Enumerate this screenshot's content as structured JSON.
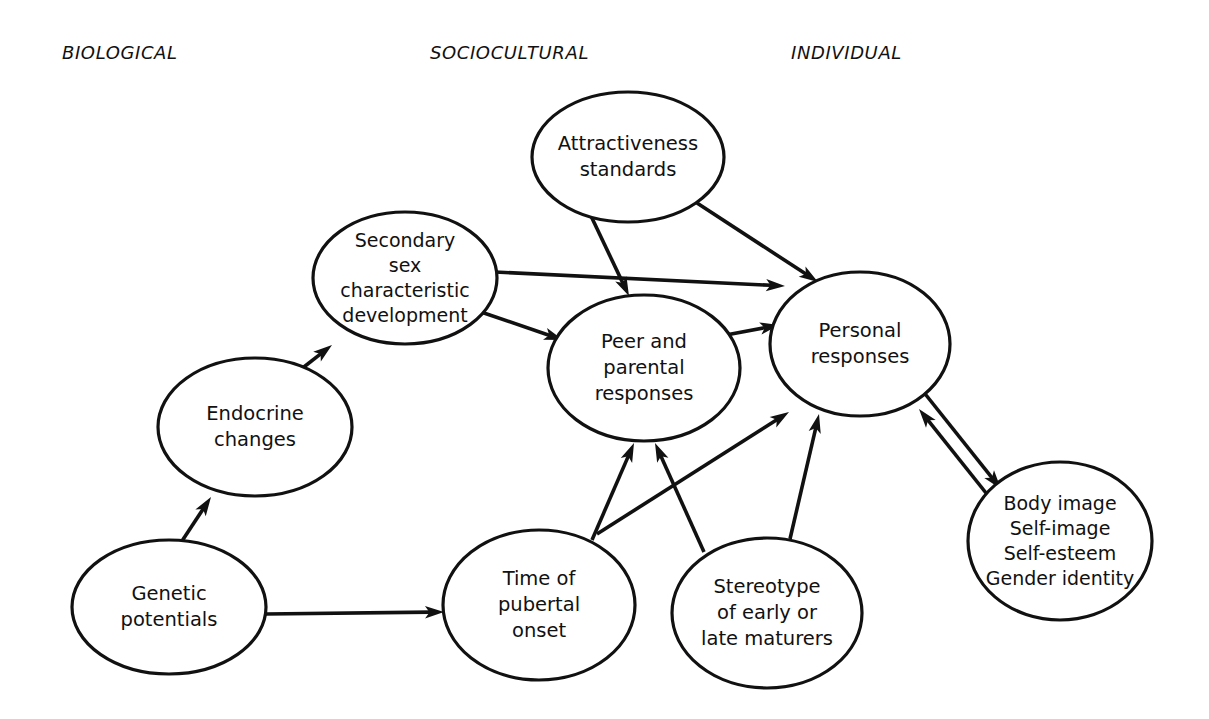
{
  "figure": {
    "background_color": "#ffffff",
    "stroke_color": "#111111",
    "text_color": "#111111"
  },
  "column_headers": [
    {
      "label": "BIOLOGICAL",
      "x": 62,
      "y": 42
    },
    {
      "label": "SOCIOCULTURAL",
      "x": 430,
      "y": 42
    },
    {
      "label": "INDIVIDUAL",
      "x": 791,
      "y": 42
    }
  ],
  "nodes": [
    {
      "id": "genetic-potentials",
      "lines": [
        "Genetic",
        "potentials"
      ],
      "cx": 169,
      "cy": 607,
      "rx": 97,
      "ry": 67,
      "column": "BIOLOGICAL"
    },
    {
      "id": "endocrine-changes",
      "lines": [
        "Endocrine",
        "changes"
      ],
      "cx": 255,
      "cy": 427,
      "rx": 97,
      "ry": 69,
      "column": "BIOLOGICAL"
    },
    {
      "id": "secondary-sex-characteristic-development",
      "lines": [
        "Secondary",
        "sex",
        "characteristic",
        "development"
      ],
      "cx": 405,
      "cy": 278,
      "rx": 92,
      "ry": 66,
      "column": "BIOLOGICAL"
    },
    {
      "id": "attractiveness-standards",
      "lines": [
        "Attractiveness",
        "standards"
      ],
      "cx": 628,
      "cy": 157,
      "rx": 96,
      "ry": 65,
      "column": "SOCIOCULTURAL"
    },
    {
      "id": "peer-and-parental-responses",
      "lines": [
        "Peer and",
        "parental",
        "responses"
      ],
      "cx": 644,
      "cy": 368,
      "rx": 96,
      "ry": 73,
      "column": "SOCIOCULTURAL"
    },
    {
      "id": "time-of-pubertal-onset",
      "lines": [
        "Time of",
        "pubertal",
        "onset"
      ],
      "cx": 539,
      "cy": 605,
      "rx": 96,
      "ry": 75,
      "column": "SOCIOCULTURAL"
    },
    {
      "id": "stereotype-of-early-or-late-maturers",
      "lines": [
        "Stereotype",
        "of early or",
        "late maturers"
      ],
      "cx": 767,
      "cy": 613,
      "rx": 95,
      "ry": 75,
      "column": "SOCIOCULTURAL"
    },
    {
      "id": "personal-responses",
      "lines": [
        "Personal",
        "responses"
      ],
      "cx": 860,
      "cy": 344,
      "rx": 90,
      "ry": 72,
      "column": "INDIVIDUAL"
    },
    {
      "id": "body-image-self-image-self-esteem-gender-identity",
      "lines": [
        "Body image",
        "Self-image",
        "Self-esteem",
        "Gender identity"
      ],
      "cx": 1060,
      "cy": 541,
      "rx": 92,
      "ry": 79,
      "column": "INDIVIDUAL"
    }
  ],
  "edges": [
    {
      "id": "genetic-potentials-to-endocrine-changes",
      "from": "genetic-potentials",
      "to": "endocrine-changes",
      "x1": 182,
      "y1": 541,
      "x2": 211,
      "y2": 497,
      "arrow": "end"
    },
    {
      "id": "endocrine-changes-to-secondary-sex",
      "from": "endocrine-changes",
      "to": "secondary-sex-characteristic-development",
      "x1": 300,
      "y1": 370,
      "x2": 332,
      "y2": 345,
      "arrow": "end"
    },
    {
      "id": "genetic-potentials-to-time-of-pubertal-onset",
      "from": "genetic-potentials",
      "to": "time-of-pubertal-onset",
      "x1": 266,
      "y1": 614,
      "x2": 444,
      "y2": 612,
      "arrow": "end"
    },
    {
      "id": "secondary-sex-to-peer-and-parental",
      "from": "secondary-sex-characteristic-development",
      "to": "peer-and-parental-responses",
      "x1": 481,
      "y1": 312,
      "x2": 563,
      "y2": 340,
      "arrow": "end"
    },
    {
      "id": "secondary-sex-to-personal-responses",
      "from": "secondary-sex-characteristic-development",
      "to": "personal-responses",
      "x1": 495,
      "y1": 272,
      "x2": 785,
      "y2": 286,
      "arrow": "end"
    },
    {
      "id": "attractiveness-standards-to-peer-and-parental",
      "from": "attractiveness-standards",
      "to": "peer-and-parental-responses",
      "x1": 591,
      "y1": 216,
      "x2": 629,
      "y2": 296,
      "arrow": "end"
    },
    {
      "id": "attractiveness-standards-to-personal-responses",
      "from": "attractiveness-standards",
      "to": "personal-responses",
      "x1": 697,
      "y1": 203,
      "x2": 818,
      "y2": 282,
      "arrow": "end"
    },
    {
      "id": "peer-and-parental-to-personal-responses",
      "from": "peer-and-parental-responses",
      "to": "personal-responses",
      "x1": 726,
      "y1": 335,
      "x2": 779,
      "y2": 325,
      "arrow": "end"
    },
    {
      "id": "time-of-pubertal-onset-to-peer-and-parental-left",
      "from": "time-of-pubertal-onset",
      "to": "peer-and-parental-responses",
      "x1": 592,
      "y1": 540,
      "x2": 634,
      "y2": 443,
      "arrow": "end"
    },
    {
      "id": "time-of-pubertal-onset-to-personal-responses",
      "from": "time-of-pubertal-onset",
      "to": "personal-responses",
      "x1": 597,
      "y1": 534,
      "x2": 789,
      "y2": 412,
      "arrow": "end"
    },
    {
      "id": "stereotype-to-peer-and-parental",
      "from": "stereotype-of-early-or-late-maturers",
      "to": "peer-and-parental-responses",
      "x1": 704,
      "y1": 552,
      "x2": 655,
      "y2": 443,
      "arrow": "end"
    },
    {
      "id": "stereotype-to-personal-responses",
      "from": "stereotype-of-early-or-late-maturers",
      "to": "personal-responses",
      "x1": 790,
      "y1": 539,
      "x2": 819,
      "y2": 414,
      "arrow": "end"
    },
    {
      "id": "personal-responses-to-body-image",
      "from": "personal-responses",
      "to": "body-image-self-image-self-esteem-gender-identity",
      "x1": 922,
      "y1": 390,
      "x2": 1001,
      "y2": 489,
      "arrow": "end"
    },
    {
      "id": "body-image-to-personal-responses",
      "from": "body-image-self-image-self-esteem-gender-identity",
      "to": "personal-responses",
      "x1": 998,
      "y1": 508,
      "x2": 919,
      "y2": 409,
      "arrow": "end"
    }
  ]
}
